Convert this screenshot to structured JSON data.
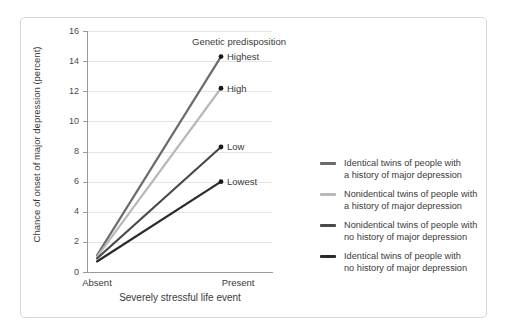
{
  "chart_data": {
    "type": "line",
    "title": "",
    "xlabel": "Severely stressful life event",
    "ylabel": "Chance of onset of major depression (percent)",
    "categories": [
      "Absent",
      "Present"
    ],
    "ylim": [
      0,
      16
    ],
    "yticks": [
      0,
      2,
      4,
      6,
      8,
      10,
      12,
      14,
      16
    ],
    "grid": true,
    "legend_position": "right",
    "annotation_title": "Genetic predisposition",
    "series": [
      {
        "name": "Identical twins of people with a history of major depression",
        "point_label": "Highest",
        "color": "#6b6b6b",
        "values": [
          1.1,
          14.3
        ]
      },
      {
        "name": "Nonidentical twins of people with a history of major depression",
        "point_label": "High",
        "color": "#b8b8b8",
        "values": [
          1.0,
          12.2
        ]
      },
      {
        "name": "Nonidentical twins of people with no history of major depression",
        "point_label": "Low",
        "color": "#4a4a4a",
        "values": [
          0.9,
          8.3
        ]
      },
      {
        "name": "Identical twins of people with no history of major depression",
        "point_label": "Lowest",
        "color": "#2b2b2b",
        "values": [
          0.7,
          6.0
        ]
      }
    ]
  },
  "axes": {
    "y_title": "Chance of onset of major depression (percent)",
    "x_title": "Severely stressful life event",
    "y_tick_labels": [
      "16",
      "14",
      "12",
      "10",
      "8",
      "6",
      "4",
      "2",
      "0"
    ],
    "x_tick_labels": [
      "Absent",
      "Present"
    ]
  },
  "annotations": {
    "group_title": "Genetic predisposition",
    "points": [
      "Highest",
      "High",
      "Low",
      "Lowest"
    ]
  },
  "legend": {
    "items": [
      {
        "line1": "Identical twins of people with",
        "line2": "a history of major depression",
        "color": "#6b6b6b"
      },
      {
        "line1": "Nonidentical twins of people with",
        "line2": "a history of major depression",
        "color": "#b8b8b8"
      },
      {
        "line1": "Nonidentical twins of people with",
        "line2": "no history of major depression",
        "color": "#4a4a4a"
      },
      {
        "line1": "Identical twins of people with",
        "line2": "no history of major depression",
        "color": "#2b2b2b"
      }
    ]
  },
  "colors": {
    "frame_border": "#d8d8d8",
    "gridline": "#e4e4e4",
    "axis": "#9a9a9a",
    "text": "#3a3a3a",
    "background": "#ffffff"
  }
}
